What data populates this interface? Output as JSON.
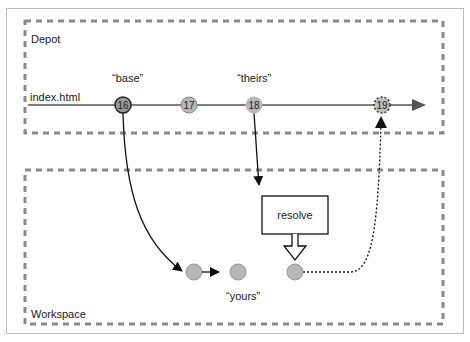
{
  "diagram": {
    "zones": {
      "depot": {
        "label": "Depot"
      },
      "workspace": {
        "label": "Workspace"
      }
    },
    "file": {
      "label": "index.html"
    },
    "revisions": [
      {
        "id": "16",
        "tag": "“base”"
      },
      {
        "id": "17",
        "tag": ""
      },
      {
        "id": "18",
        "tag": "“theirs”"
      },
      {
        "id": "19",
        "tag": ""
      }
    ],
    "workspace_tag": "“yours”",
    "resolve_label": "resolve",
    "colors": {
      "border_dash": "#8a8a8a",
      "node_fill": "#b8b8b8",
      "base_node_fill": "#9a9a9a",
      "line": "#333333"
    }
  }
}
